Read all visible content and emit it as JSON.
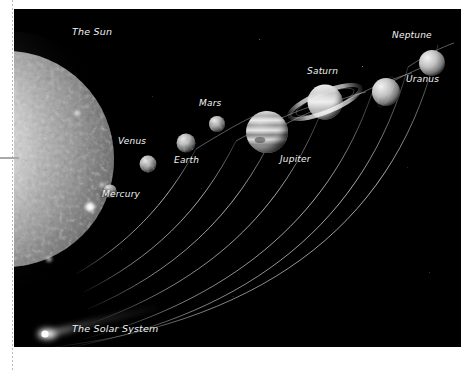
{
  "page": {
    "background_color": "#ffffff",
    "rules": {
      "dotted_rule_color": "#b9b9b9",
      "gray_rule_color": "#a9a9a9"
    }
  },
  "figure": {
    "name": "solar-system-illustration",
    "caption": "The Solar System",
    "background_color": "#000000",
    "label_color": "#f2f2f2",
    "bodies": [
      {
        "id": "sun",
        "label": "The Sun",
        "type": "star",
        "color": "#cfcfcf"
      },
      {
        "id": "mercury",
        "label": "Mercury",
        "type": "planet",
        "color": "#c9c9c9"
      },
      {
        "id": "venus",
        "label": "Venus",
        "type": "planet",
        "color": "#d8d8d8"
      },
      {
        "id": "earth",
        "label": "Earth",
        "type": "planet",
        "color": "#dcdcdc"
      },
      {
        "id": "mars",
        "label": "Mars",
        "type": "planet",
        "color": "#d2d2d2"
      },
      {
        "id": "jupiter",
        "label": "Jupiter",
        "type": "planet",
        "color": "#e0e0e0"
      },
      {
        "id": "saturn",
        "label": "Saturn",
        "type": "planet",
        "color": "#e4e4e4"
      },
      {
        "id": "uranus",
        "label": "Uranus",
        "type": "planet",
        "color": "#d6d6d6"
      },
      {
        "id": "neptune",
        "label": "Neptune",
        "type": "planet",
        "color": "#d0d0d0"
      },
      {
        "id": "comet",
        "label": "The Solar System",
        "type": "comet",
        "color": "#ffffff"
      }
    ]
  }
}
